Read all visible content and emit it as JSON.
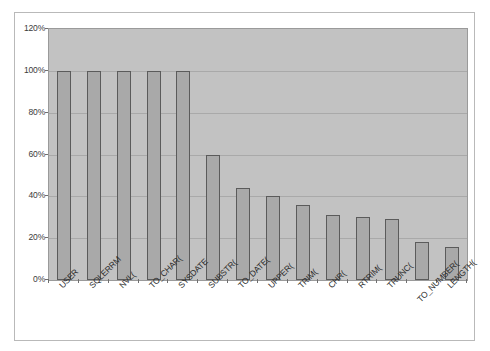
{
  "chart_data": {
    "type": "bar",
    "title": "",
    "subtitle": "",
    "xlabel": "",
    "ylabel": "",
    "ylim": [
      0,
      120
    ],
    "yunit": "%",
    "grid": true,
    "legend": false,
    "legend_position": "none",
    "ytick_labels": [
      "120%",
      "100%",
      "80%",
      "60%",
      "40%",
      "20%",
      "0%"
    ],
    "ytick_values": [
      120,
      100,
      80,
      60,
      40,
      20,
      0
    ],
    "categories": [
      "USER",
      "SQLERRM",
      "NVL(",
      "TO_CHAR(",
      "SYSDATE",
      "SUBSTR(",
      "TO_DATE(",
      "UPPER(",
      "TRIM(",
      "CHR(",
      "RTRIM(",
      "TRUNC(",
      "TO_NUMBER(",
      "LENGTH("
    ],
    "values": [
      100,
      100,
      100,
      100,
      100,
      60,
      44,
      40,
      36,
      31,
      30,
      29,
      18,
      16
    ],
    "colors": {
      "bar_fill": "#a9a9a9",
      "bar_border": "#5b5b5b",
      "plot_background": "#c2c2c2",
      "gridline": "#a9a9a9",
      "frame_border": "#b9b9b9",
      "axis_text": "#2b2b2b",
      "page_background": "#ffffff"
    }
  }
}
